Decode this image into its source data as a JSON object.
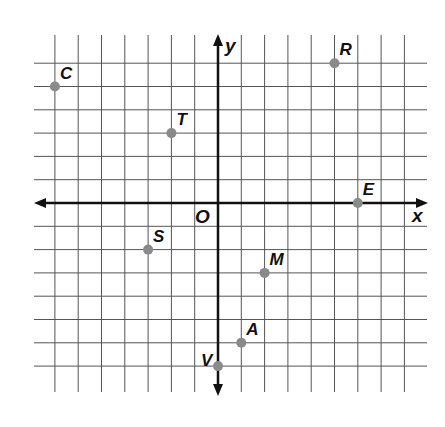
{
  "figure": {
    "type": "coordinate-plane",
    "axes": {
      "x_label": "x",
      "y_label": "y",
      "origin_label": "O"
    },
    "grid": {
      "x_min": -7,
      "x_max": 8,
      "y_min": -7,
      "y_max": 6,
      "unit_px": 23.3
    },
    "points": [
      {
        "label": "C",
        "x": -7,
        "y": 5
      },
      {
        "label": "T",
        "x": -2,
        "y": 3
      },
      {
        "label": "R",
        "x": 5,
        "y": 6
      },
      {
        "label": "E",
        "x": 6,
        "y": 0
      },
      {
        "label": "S",
        "x": -3,
        "y": -2
      },
      {
        "label": "M",
        "x": 2,
        "y": -3
      },
      {
        "label": "A",
        "x": 1,
        "y": -6
      },
      {
        "label": "V",
        "x": 0,
        "y": -7
      }
    ]
  },
  "colors": {
    "grid": "#555555",
    "axis": "#111111",
    "point": "#8a8a8a"
  }
}
